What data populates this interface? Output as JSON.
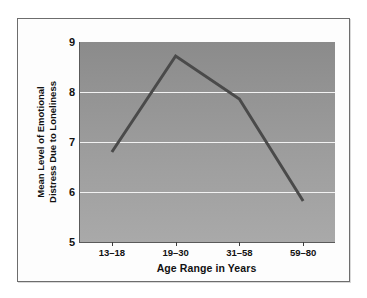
{
  "chart_data": {
    "type": "line",
    "title": "",
    "subtitle": "",
    "xlabel": "Age Range in Years",
    "ylabel": "Mean Level of Emotional Distress Due to Loneliness",
    "ylabel_lines": [
      "Mean Level of Emotional",
      "Distress Due to Loneliness"
    ],
    "categories": [
      "13–18",
      "19–30",
      "31–58",
      "59–80"
    ],
    "values": [
      6.8,
      8.72,
      7.86,
      5.82
    ],
    "series": [
      {
        "name": "Mean Level of Emotional Distress Due to Loneliness",
        "values": [
          6.8,
          8.72,
          7.86,
          5.82
        ]
      }
    ],
    "ylim": [
      5,
      9
    ],
    "ytick_labels": [
      "9",
      "8",
      "7",
      "6",
      "5"
    ],
    "yticks": [
      9,
      8,
      7,
      6,
      5
    ],
    "gridlines": [
      8,
      7,
      6
    ],
    "grid": true,
    "legend": "none",
    "line_color": "#4a4a4a",
    "plot_bg_top": "#8b8b8b",
    "plot_bg_bottom": "#a9a9a9",
    "grid_color": "#f2f2f2",
    "axis_color": "#5a5a5a",
    "text_color": "#111111",
    "frame_bg": "#fdfdfd",
    "frame_border": "#6d6d6d"
  }
}
